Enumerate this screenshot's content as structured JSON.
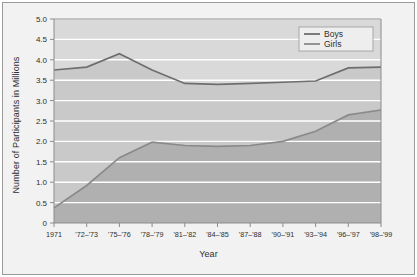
{
  "chart_data": {
    "type": "area",
    "title": "",
    "xlabel": "Year",
    "ylabel": "Number of Participants in Millions",
    "ylim": [
      0,
      5.0
    ],
    "ytick_labels": [
      "0",
      "0.5",
      "1.0",
      "1.5",
      "2.0",
      "2.5",
      "3.0",
      "3.5",
      "4.0",
      "4.5",
      "5.0"
    ],
    "ytick_values": [
      0,
      0.5,
      1.0,
      1.5,
      2.0,
      2.5,
      3.0,
      3.5,
      4.0,
      4.5,
      5.0
    ],
    "grid": true,
    "legend_position": "top-right",
    "categories": [
      "1971",
      "'72–'73",
      "'75–'76",
      "'78–'79",
      "'81–'82",
      "'84–'85",
      "'87–'88",
      "'90–'91",
      "'93–'94",
      "'96–'97",
      "'98–'99"
    ],
    "series": [
      {
        "name": "Boys",
        "color": "#6e6e6e",
        "fill": "#b4b4b4",
        "values": [
          3.75,
          3.82,
          4.15,
          3.75,
          3.42,
          3.4,
          3.42,
          3.45,
          3.48,
          3.8,
          3.82
        ]
      },
      {
        "name": "Girls",
        "color": "#8a8a8a",
        "fill": "#a8a8a8",
        "values": [
          0.37,
          0.92,
          1.6,
          1.98,
          1.9,
          1.88,
          1.9,
          2.0,
          2.25,
          2.65,
          2.77
        ]
      }
    ]
  },
  "legend": {
    "items": [
      {
        "label": "Boys"
      },
      {
        "label": "Girls"
      }
    ]
  },
  "colors": {
    "page_background": "#ffffff",
    "figure_background": "#f2f2f2",
    "plot_background": "#d9d9d9",
    "boys_band": "#c9c9c9",
    "girls_band": "#b0b0b0",
    "gridline": "#ffffff",
    "axis": "#8c8c8c",
    "text": "#2e2e2e"
  }
}
